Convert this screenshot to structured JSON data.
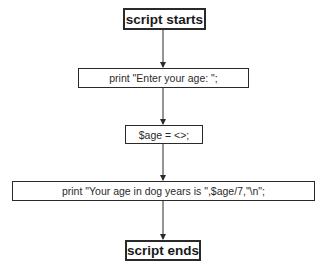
{
  "diagram": {
    "type": "flowchart",
    "nodes": [
      {
        "id": "start",
        "kind": "terminal",
        "label": "script starts"
      },
      {
        "id": "prompt",
        "kind": "process",
        "label": "print \"Enter your age: \";"
      },
      {
        "id": "read",
        "kind": "process",
        "label": "$age = <>;"
      },
      {
        "id": "output",
        "kind": "process",
        "label": "print \"Your age in dog years is \",$age/7,\"\\n\";"
      },
      {
        "id": "end",
        "kind": "terminal",
        "label": "script ends"
      }
    ],
    "edges": [
      {
        "from": "start",
        "to": "prompt"
      },
      {
        "from": "prompt",
        "to": "read"
      },
      {
        "from": "read",
        "to": "output"
      },
      {
        "from": "output",
        "to": "end"
      }
    ],
    "colors": {
      "stroke": "#2a2a2a",
      "background": "#ffffff"
    }
  }
}
